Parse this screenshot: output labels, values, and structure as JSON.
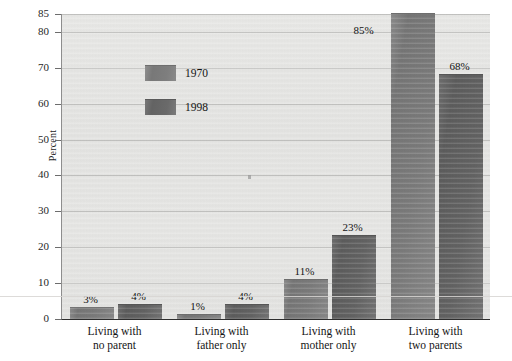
{
  "chart_data": {
    "type": "bar",
    "title": "",
    "subtitle": "",
    "xlabel": "",
    "ylabel": "Percent",
    "ylim": [
      0,
      85
    ],
    "yticks": [
      0,
      10,
      20,
      30,
      40,
      50,
      60,
      70,
      80,
      85
    ],
    "ytick_labels": [
      "0",
      "10",
      "20",
      "30",
      "40",
      "50",
      "60",
      "70",
      "80",
      "85"
    ],
    "grid": true,
    "legend_position": "upper-left-inside",
    "categories": [
      "Living with\nno parent",
      "Living with\nfather only",
      "Living with\nmother only",
      "Living with\ntwo parents"
    ],
    "category_lines": [
      [
        "Living with",
        "no parent"
      ],
      [
        "Living with",
        "father only"
      ],
      [
        "Living with",
        "mother only"
      ],
      [
        "Living with",
        "two parents"
      ]
    ],
    "series": [
      {
        "name": "1970",
        "color": "#7b7b7b",
        "values": [
          3,
          1,
          11,
          85
        ],
        "data_labels": [
          "3%",
          "1%",
          "11%",
          "85%"
        ]
      },
      {
        "name": "1998",
        "color": "#636363",
        "values": [
          4,
          4,
          23,
          68
        ],
        "data_labels": [
          "4%",
          "4%",
          "23%",
          "68%"
        ]
      }
    ]
  },
  "axis": {
    "y_title": "Percent"
  },
  "legend": {
    "items": [
      {
        "label": "1970",
        "swatch": "legend-swatch-1970"
      },
      {
        "label": "1998",
        "swatch": "legend-swatch-1998"
      }
    ]
  },
  "colors": {
    "plot_background": "#e5e5e3",
    "gridline": "#c2c2c0",
    "axis": "#2e2e2e",
    "bar_1970": "#7b7b7b",
    "bar_1998": "#636363",
    "text": "#141414"
  }
}
